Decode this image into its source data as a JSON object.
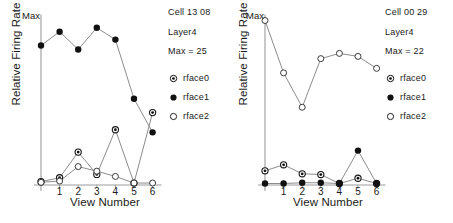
{
  "figure": {
    "axis_label_x": "View Number",
    "axis_label_y": "Relative Firing Rate",
    "max_tick_label": "Max",
    "tick_labels": [
      "1",
      "2",
      "3",
      "4",
      "5",
      "6"
    ],
    "series_names": [
      "rface0",
      "rface1",
      "rface2"
    ],
    "marker_styles": [
      "bullseye-marker",
      "filled-circle-marker",
      "open-circle-marker"
    ],
    "colors": {
      "line": "#8c8c8c",
      "marker_fill": "#111111",
      "marker_open_fill": "#ffffff",
      "axis": "#9b9b9b",
      "text": "#1a1a1a"
    }
  },
  "panels": [
    {
      "id": "panel-left",
      "cell": "Cell 13 08",
      "layer": "Layer4",
      "max": "Max = 25",
      "chart_data": {
        "type": "line",
        "title": "Cell 13 08",
        "xlabel": "View Number",
        "ylabel": "Relative Firing Rate",
        "x": [
          0,
          1,
          2,
          3,
          4,
          5,
          6
        ],
        "tick_labels": [
          "",
          "1",
          "2",
          "3",
          "4",
          "5",
          "6"
        ],
        "ylim": [
          0,
          25
        ],
        "ylim_labels": [
          "",
          "Max"
        ],
        "grid": false,
        "legend_position": "right",
        "series": [
          {
            "name": "rface0",
            "marker": "bullseye-marker",
            "values": [
              0.5,
              1.1,
              5.0,
              1.6,
              8.4,
              0.3,
              11.0
            ]
          },
          {
            "name": "rface1",
            "marker": "filled-circle-marker",
            "values": [
              21.2,
              23.3,
              20.6,
              23.9,
              22.1,
              13.1,
              8.0
            ]
          },
          {
            "name": "rface2",
            "marker": "open-circle-marker",
            "values": [
              0.4,
              0.6,
              2.8,
              2.1,
              1.3,
              0.3,
              0.3
            ]
          }
        ]
      }
    },
    {
      "id": "panel-right",
      "cell": "Cell 00 29",
      "layer": "Layer4",
      "max": "Max = 22",
      "chart_data": {
        "type": "line",
        "title": "Cell 00 29",
        "xlabel": "View Number",
        "ylabel": "Relative Firing Rate",
        "x": [
          0,
          1,
          2,
          3,
          4,
          5,
          6
        ],
        "tick_labels": [
          "",
          "1",
          "2",
          "3",
          "4",
          "5",
          "6"
        ],
        "ylim": [
          0,
          22
        ],
        "ylim_labels": [
          "",
          "Max"
        ],
        "grid": false,
        "legend_position": "right",
        "series": [
          {
            "name": "rface0",
            "marker": "bullseye-marker",
            "values": [
              1.9,
              2.7,
              1.5,
              1.4,
              0.2,
              0.9,
              0.2
            ]
          },
          {
            "name": "rface1",
            "marker": "filled-circle-marker",
            "values": [
              0.2,
              0.2,
              0.3,
              0.3,
              0.2,
              4.6,
              0.2
            ]
          },
          {
            "name": "rface2",
            "marker": "open-circle-marker",
            "values": [
              22.0,
              15.0,
              10.4,
              16.9,
              17.6,
              17.2,
              15.6
            ]
          }
        ]
      }
    }
  ]
}
